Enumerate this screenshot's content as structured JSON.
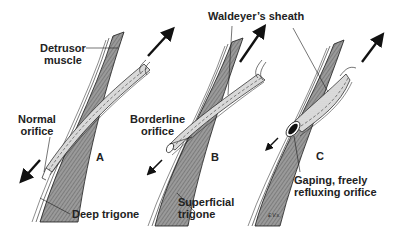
{
  "figure": {
    "type": "anatomical line drawing",
    "panels": [
      {
        "letter": "A",
        "orifice_label": "Normal\norifice"
      },
      {
        "letter": "B",
        "orifice_label": "Borderline\norifice"
      },
      {
        "letter": "C",
        "orifice_label": "Gaping, freely\nrefluxing orifice"
      }
    ],
    "labels": {
      "detrusor_line1": "Detrusor",
      "detrusor_line2": "muscle",
      "normal_line1": "Normal",
      "normal_line2": "orifice",
      "borderline_line1": "Borderline",
      "borderline_line2": "orifice",
      "waldeyer": "Waldeyer’s sheath",
      "deep_trigone": "Deep trigone",
      "superficial_line1": "Superficial",
      "superficial_line2": "trigone",
      "gaping_line1": "Gaping, freely",
      "gaping_line2": "refluxing orifice",
      "panel_a": "A",
      "panel_b": "B",
      "panel_c": "C",
      "signature": "£.V.s."
    },
    "colors": {
      "muscle_fill": "#8c8c8c",
      "ureter_fill": "#d8d8d8",
      "line": "#1a1a1a",
      "text": "#222222",
      "background": "#ffffff"
    }
  }
}
